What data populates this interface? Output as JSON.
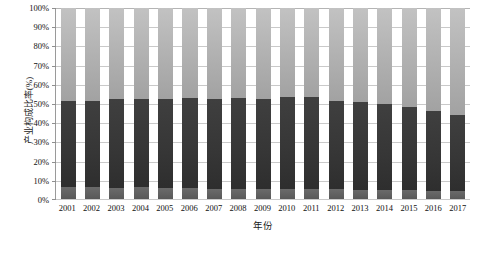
{
  "chart_data": {
    "type": "bar",
    "subtype": "stacked-100-percent",
    "title": "",
    "xlabel": "年份",
    "ylabel": "产业构成比率(%)",
    "ylim": [
      0,
      100
    ],
    "yticks": [
      "0%",
      "10%",
      "20%",
      "30%",
      "40%",
      "50%",
      "60%",
      "70%",
      "80%",
      "90%",
      "100%"
    ],
    "ytick_values": [
      0,
      10,
      20,
      30,
      40,
      50,
      60,
      70,
      80,
      90,
      100
    ],
    "grid": true,
    "legend": "none",
    "categories": [
      "2001",
      "2002",
      "2003",
      "2004",
      "2005",
      "2006",
      "2007",
      "2008",
      "2009",
      "2010",
      "2011",
      "2012",
      "2013",
      "2014",
      "2015",
      "2016",
      "2017"
    ],
    "series": [
      {
        "name": "第一产业",
        "color": "#606060",
        "values": [
          6.5,
          6.3,
          6.0,
          6.3,
          6.0,
          5.6,
          5.4,
          5.5,
          5.3,
          5.0,
          5.0,
          5.0,
          4.8,
          4.6,
          4.5,
          4.3,
          4.2
        ]
      },
      {
        "name": "第二产业",
        "color": "#363636",
        "values": [
          44.8,
          45.2,
          46.4,
          45.9,
          46.2,
          47.2,
          47.2,
          47.2,
          47.3,
          48.5,
          48.5,
          46.5,
          46.2,
          45.0,
          43.5,
          41.7,
          39.8
        ]
      },
      {
        "name": "第三产业",
        "color": "#b0b0b0",
        "values": [
          48.7,
          48.5,
          47.6,
          47.8,
          47.8,
          47.2,
          47.4,
          47.3,
          47.4,
          46.5,
          46.5,
          48.5,
          49.0,
          50.4,
          52.0,
          54.0,
          56.0
        ]
      }
    ],
    "cumulative_tops": {
      "primary": [
        6.5,
        6.3,
        6.0,
        6.3,
        6.0,
        5.6,
        5.4,
        5.5,
        5.3,
        5.0,
        5.0,
        5.0,
        4.8,
        4.6,
        4.5,
        4.3,
        4.2
      ],
      "primary_plus_secondary": [
        51.3,
        51.5,
        52.4,
        52.2,
        52.2,
        52.8,
        52.6,
        52.7,
        52.6,
        53.5,
        53.5,
        51.5,
        51.0,
        49.6,
        48.0,
        46.0,
        44.0
      ],
      "total": [
        100,
        100,
        100,
        100,
        100,
        100,
        100,
        100,
        100,
        100,
        100,
        100,
        100,
        100,
        100,
        100,
        100
      ]
    }
  }
}
